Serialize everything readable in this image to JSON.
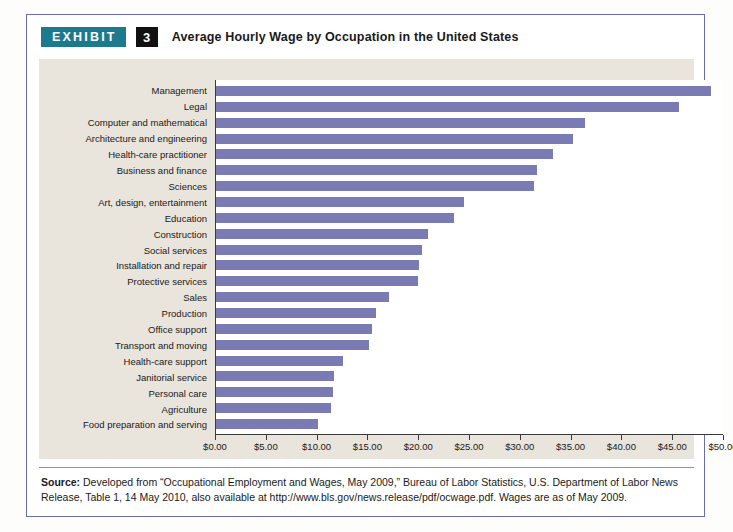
{
  "exhibit": {
    "badge_label": "EXHIBIT",
    "number": "3",
    "title": "Average Hourly Wage by Occupation in the United States"
  },
  "source": {
    "label": "Source:",
    "text": " Developed from “Occupational Employment and Wages, May 2009,” Bureau of Labor Statistics, U.S. Department of Labor News Release, Table 1, 14 May 2010, also available at http://www.bls.gov/news.release/pdf/ocwage.pdf. Wages are as of May 2009."
  },
  "colors": {
    "bar": "#7a7ab4",
    "badge_teal": "#1c7a8c",
    "number_black": "#111111",
    "panel_beige": "#e9e4dc",
    "border_blue": "#6a6ea8"
  },
  "chart_data": {
    "type": "bar",
    "orientation": "horizontal",
    "title": "Average Hourly Wage by Occupation in the United States",
    "xlabel": "",
    "ylabel": "",
    "xlim": [
      0,
      50
    ],
    "grid": false,
    "legend": "none",
    "tick_labels": [
      "$0.00",
      "$5.00",
      "$10.00",
      "$15.00",
      "$20.00",
      "$25.00",
      "$30.00",
      "$35.00",
      "$40.00",
      "$45.00",
      "$50.00"
    ],
    "tick_values": [
      0,
      5,
      10,
      15,
      20,
      25,
      30,
      35,
      40,
      45,
      50
    ],
    "categories": [
      "Management",
      "Legal",
      "Computer and mathematical",
      "Architecture and engineering",
      "Health-care practitioner",
      "Business and finance",
      "Sciences",
      "Art, design, entertainment",
      "Education",
      "Construction",
      "Social services",
      "Installation and repair",
      "Protective services",
      "Sales",
      "Production",
      "Office support",
      "Transport and moving",
      "Health-care support",
      "Janitorial service",
      "Personal care",
      "Agriculture",
      "Food preparation and serving"
    ],
    "values": [
      48.7,
      45.6,
      36.3,
      35.1,
      33.2,
      31.6,
      31.3,
      24.4,
      23.4,
      20.9,
      20.3,
      20.0,
      19.9,
      17.0,
      15.7,
      15.4,
      15.1,
      12.5,
      11.6,
      11.5,
      11.3,
      10.0
    ]
  }
}
